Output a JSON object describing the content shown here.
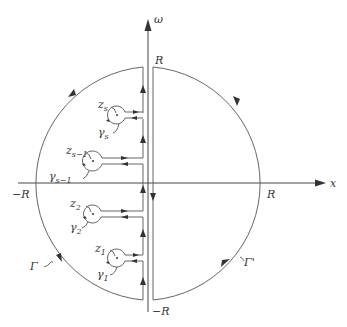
{
  "figure": {
    "type": "contour-integration-diagram",
    "axes": {
      "x_label": "x",
      "y_label": "ω",
      "x_tick_neg": "−R",
      "x_tick_pos": "R",
      "y_tick_pos": "R",
      "y_tick_neg": "−R"
    },
    "contours": {
      "left": "Γ",
      "right": "Γ'"
    },
    "singularities": [
      {
        "point": "z",
        "point_sub": "s",
        "loop": "γ",
        "loop_sub": "s"
      },
      {
        "point": "z",
        "point_sub": "s−1",
        "loop": "γ",
        "loop_sub": "s−1"
      },
      {
        "point": "z",
        "point_sub": "2",
        "loop": "γ",
        "loop_sub": "2"
      },
      {
        "point": "z",
        "point_sub": "1",
        "loop": "γ",
        "loop_sub": "1"
      }
    ],
    "colors": {
      "stroke": "#555555",
      "text": "#333333",
      "background": "#ffffff"
    }
  }
}
